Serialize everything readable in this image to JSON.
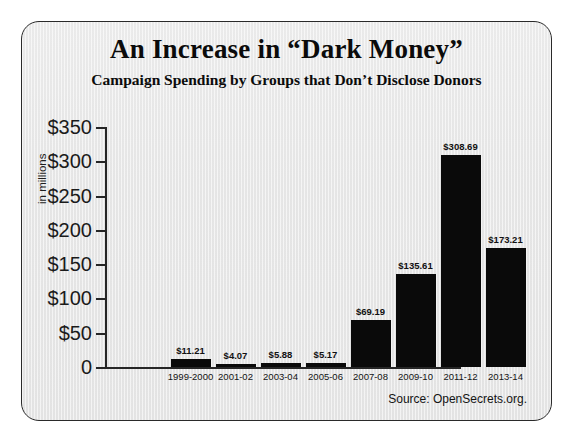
{
  "figure": {
    "title": "An Increase in “Dark Money”",
    "subtitle": "Campaign Spending by Groups that Don’t Disclose Donors",
    "source": "Source: OpenSecrets.org.",
    "bar_color": "#0a0a0a",
    "background_color": "#e8e8e8",
    "axis_color": "#262626"
  },
  "chart_data": {
    "type": "bar",
    "title": "An Increase in “Dark Money”",
    "subtitle": "Campaign Spending by Groups that Don’t Disclose Donors",
    "xlabel": "",
    "ylabel": "in millions",
    "ylim": [
      0,
      350
    ],
    "yticks": [
      0,
      50,
      100,
      150,
      200,
      250,
      300,
      350
    ],
    "ytick_labels": [
      "0",
      "$50",
      "$100",
      "$150",
      "$200",
      "$250",
      "$300",
      "$350"
    ],
    "grid": false,
    "legend": null,
    "categories": [
      "1999-2000",
      "2001-02",
      "2003-04",
      "2005-06",
      "2007-08",
      "2009-10",
      "2011-12",
      "2013-14"
    ],
    "values": [
      11.21,
      4.07,
      5.88,
      5.17,
      69.19,
      135.61,
      308.69,
      173.21
    ],
    "data_labels": [
      "$11.21",
      "$4.07",
      "$5.88",
      "$5.17",
      "$69.19",
      "$135.61",
      "$308.69",
      "$173.21"
    ],
    "annotations": [
      "Source: OpenSecrets.org."
    ]
  }
}
